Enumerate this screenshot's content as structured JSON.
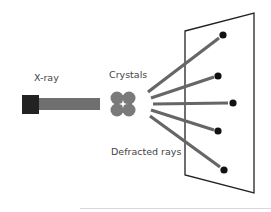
{
  "diagram": {
    "labels": {
      "source": "X-ray",
      "sample": "Crystals",
      "rays": "Defracted rays"
    },
    "colors": {
      "source_box": "#222222",
      "beam": "#6f6f6f",
      "crystal": "#7a7a7a",
      "rays": "#666666",
      "spots": "#111111",
      "detector_outline": "#222222",
      "text": "#444444"
    },
    "nodes": [
      {
        "id": "source",
        "label": "X-ray",
        "shape": "square"
      },
      {
        "id": "beam",
        "label": "",
        "shape": "bar"
      },
      {
        "id": "crystal",
        "label": "Crystals",
        "shape": "clover"
      },
      {
        "id": "detector",
        "label": "",
        "shape": "trapezoid-panel"
      }
    ],
    "rays": [
      {
        "from": [
          148,
          92
        ],
        "to": [
          223,
          35
        ]
      },
      {
        "from": [
          151,
          98
        ],
        "to": [
          218,
          76
        ]
      },
      {
        "from": [
          153,
          104
        ],
        "to": [
          233,
          103
        ]
      },
      {
        "from": [
          151,
          110
        ],
        "to": [
          218,
          131
        ]
      },
      {
        "from": [
          150,
          116
        ],
        "to": [
          224,
          170
        ]
      }
    ],
    "spots": [
      {
        "x": 223,
        "y": 35
      },
      {
        "x": 218,
        "y": 76
      },
      {
        "x": 233,
        "y": 103
      },
      {
        "x": 218,
        "y": 131
      },
      {
        "x": 224,
        "y": 170
      }
    ],
    "detector_corners": [
      [
        185,
        31
      ],
      [
        254,
        13
      ],
      [
        254,
        193
      ],
      [
        185,
        175
      ]
    ]
  }
}
